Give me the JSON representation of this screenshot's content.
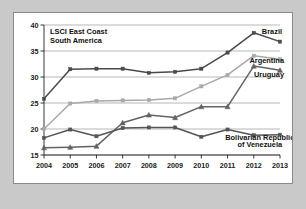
{
  "chart_data": {
    "type": "line",
    "xlabel": "",
    "ylabel": "",
    "ylim": [
      15,
      40
    ],
    "yticks": [
      15,
      20,
      25,
      30,
      35,
      40
    ],
    "grid": true,
    "legend_position": "inline-right",
    "categories": [
      "2004",
      "2005",
      "2006",
      "2007",
      "2008",
      "2009",
      "2010",
      "2011",
      "2012",
      "2013"
    ],
    "series": [
      {
        "name": "Brazil",
        "color": "#4a4a4a",
        "marker": "square",
        "values": [
          25.8,
          31.5,
          31.6,
          31.6,
          30.8,
          31.0,
          31.6,
          34.7,
          38.5,
          36.8
        ]
      },
      {
        "name": "Argentina",
        "color": "#a8a8a8",
        "marker": "square",
        "values": [
          20.0,
          24.9,
          25.4,
          25.5,
          25.6,
          25.9,
          28.2,
          30.4,
          34.1,
          33.4
        ]
      },
      {
        "name": "Uruguay",
        "color": "#636363",
        "marker": "triangle",
        "values": [
          16.4,
          16.5,
          16.7,
          21.2,
          22.7,
          22.2,
          24.3,
          24.3,
          32.1,
          31.3
        ]
      },
      {
        "name": "Bolivarian Republic of Venezuela",
        "color": "#555555",
        "marker": "square",
        "values": [
          18.3,
          19.9,
          18.6,
          20.2,
          20.3,
          20.3,
          18.5,
          19.9,
          18.8,
          18.9
        ]
      }
    ],
    "annotations": [
      {
        "text": "Brazil",
        "x": 2013,
        "y": 38.3
      },
      {
        "text": "Argentina",
        "x": 2013,
        "y": 32.6
      },
      {
        "text": "Uruguay",
        "x": 2013,
        "y": 30.3
      },
      {
        "text": "Bolivarian Republic of Venezuela",
        "x": 2012,
        "y": 17.5
      }
    ]
  },
  "labels": {
    "title_line1": "LSCI East Coast",
    "title_line2": "South America",
    "brazil": "Brazil",
    "argentina": "Argentina",
    "uruguay": "Uruguay",
    "venezuela_line1": "Bolivarian Republic",
    "venezuela_line2": "of Venezuela"
  },
  "axis": {
    "y": [
      "40",
      "35",
      "30",
      "25",
      "20",
      "15"
    ],
    "x": [
      "2004",
      "2005",
      "2006",
      "2007",
      "2008",
      "2009",
      "2010",
      "2011",
      "2012",
      "2013"
    ]
  },
  "colors": {
    "background": "#c9c9c9",
    "panel": "#ffffff",
    "grid": "#9a9a9a",
    "brazil": "#4a4a4a",
    "argentina": "#a8a8a8",
    "uruguay": "#636363",
    "venezuela": "#555555"
  }
}
